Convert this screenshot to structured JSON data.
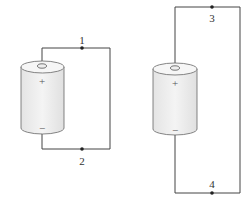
{
  "circuits": [
    {
      "id": "left",
      "points": [
        {
          "label": "1",
          "position": "top"
        },
        {
          "label": "2",
          "position": "bottom"
        }
      ],
      "battery": {
        "positive": "+",
        "negative": "−"
      }
    },
    {
      "id": "right",
      "points": [
        {
          "label": "3",
          "position": "top"
        },
        {
          "label": "4",
          "position": "bottom"
        }
      ],
      "battery": {
        "positive": "+",
        "negative": "−"
      }
    }
  ],
  "colors": {
    "wire": "#444444",
    "battery_fill": "#ededed",
    "battery_stroke": "#666666"
  }
}
